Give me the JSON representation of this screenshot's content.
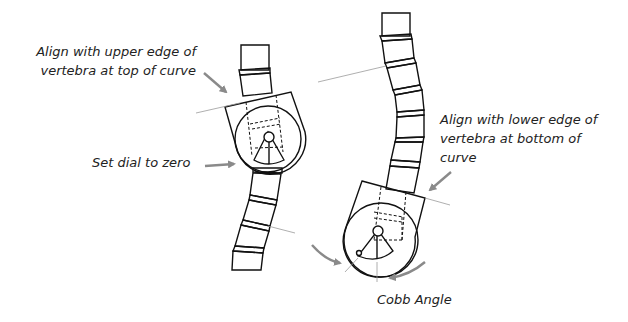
{
  "diagram": {
    "type": "medical-instructional-illustration",
    "colors": {
      "line": "#111111",
      "arrow": "#8a8a8a",
      "guide_line": "#9a9a9a",
      "text": "#222222",
      "background": "#ffffff"
    },
    "labels": {
      "upper_edge": {
        "line1": "Align with upper edge of",
        "line2": "vertebra at top of curve"
      },
      "set_dial": "Set dial to zero",
      "lower_edge": {
        "line1": "Align with lower edge of",
        "line2": "vertebra at bottom of",
        "line3": "curve"
      },
      "cobb_angle": "Cobb Angle"
    },
    "panels": [
      {
        "id": "left",
        "description": "Spine segment with instrument aligned to upper edge of top vertebra, dial set to zero"
      },
      {
        "id": "right",
        "description": "Spine segment with instrument aligned to lower edge of bottom vertebra, showing Cobb angle reading"
      }
    ]
  }
}
